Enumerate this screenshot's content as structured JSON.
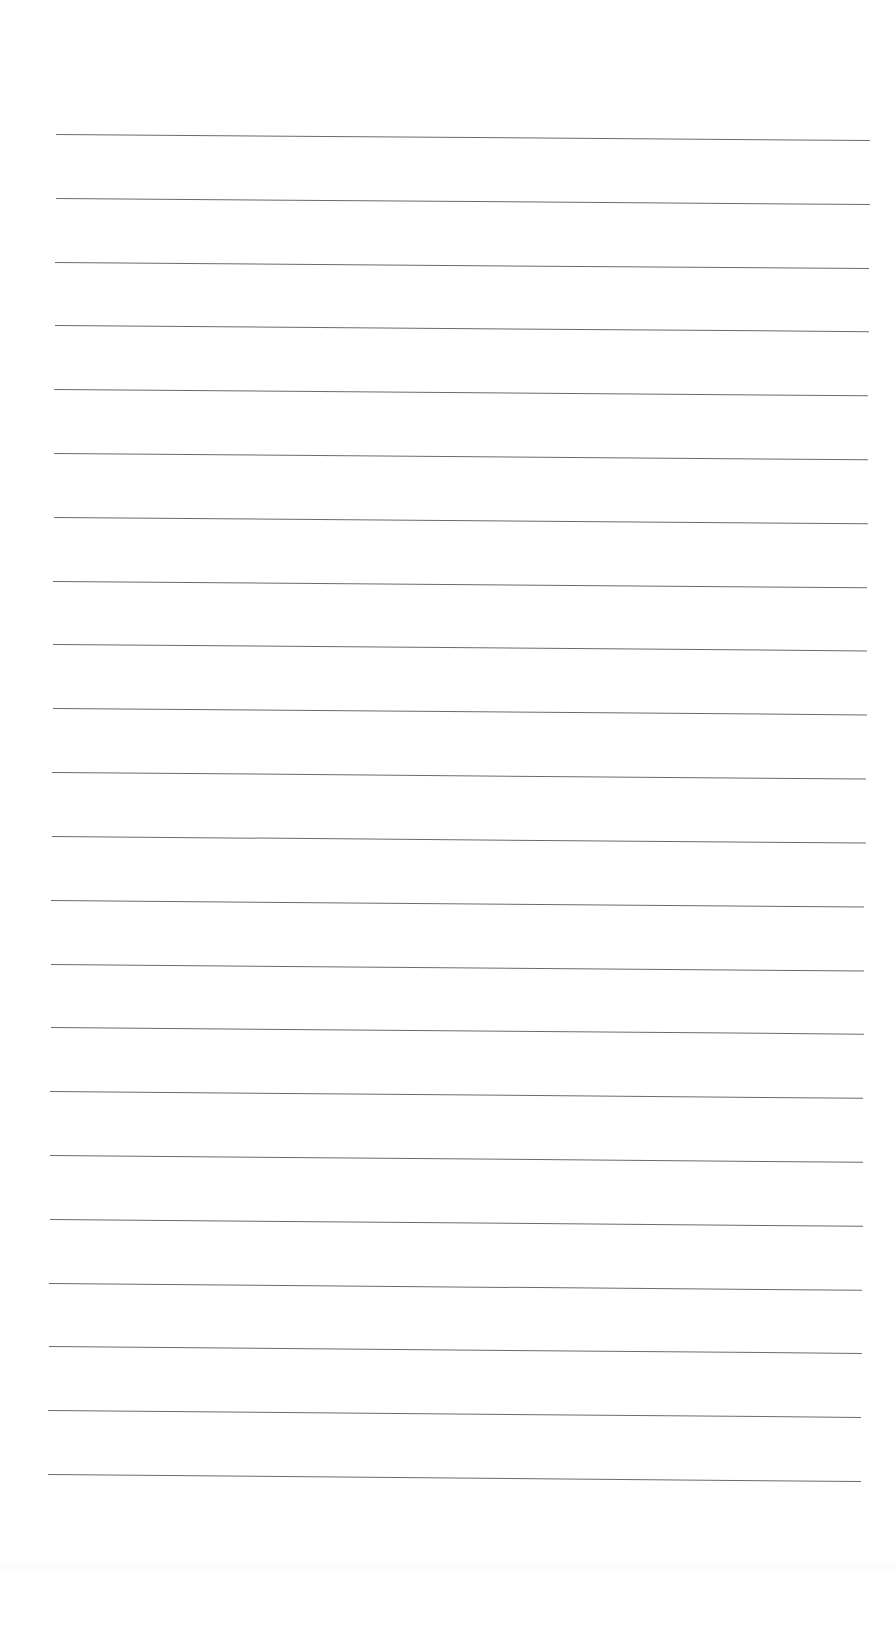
{
  "document": {
    "type": "blank ruled notebook page",
    "background_color": "#ffffff",
    "line_color": "#6b6b6b",
    "line_count": 22,
    "line_spacing_px": 63.6,
    "first_line_left": {
      "x": 56,
      "y": 134
    },
    "first_line_right": {
      "x": 870,
      "y": 140
    },
    "last_line_left": {
      "x": 48,
      "y": 1474
    },
    "last_line_right": {
      "x": 861,
      "y": 1481
    },
    "text": ""
  }
}
